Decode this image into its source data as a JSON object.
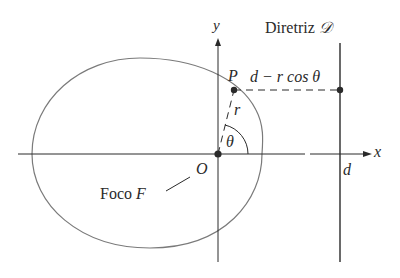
{
  "figure": {
    "labels": {
      "y_axis": "y",
      "x_axis": "x",
      "directrix_prefix": "Diretriz",
      "directrix_symbol": "𝒟",
      "point": "P",
      "distance_expr": "d − r cos θ",
      "radius": "r",
      "angle": "θ",
      "origin": "O",
      "focus_prefix": "Foco",
      "focus_symbol": "F",
      "d_tick": "d"
    },
    "colors": {
      "curve": "#7a7a7a",
      "lines": "#2a2a2a",
      "text": "#2a2a2a",
      "background": "#ffffff"
    }
  }
}
